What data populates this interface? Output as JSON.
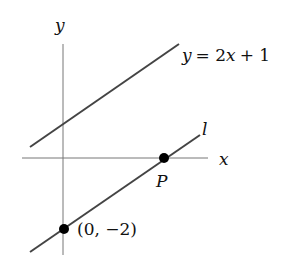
{
  "diagram": {
    "axes": {
      "x_label": "x",
      "y_label": "y"
    },
    "lines": [
      {
        "name": "upper",
        "equation": "y = 2x + 1",
        "label_var": "y",
        "label_eq": "= 2",
        "label_x": "x",
        "label_tail": "+ 1"
      },
      {
        "name": "l",
        "label": "l"
      }
    ],
    "points": [
      {
        "name": "P",
        "label": "P"
      },
      {
        "name": "y-intercept",
        "label": "(0, −2)"
      }
    ],
    "colors": {
      "line": "#444444",
      "axis": "#777777",
      "point": "#000000"
    }
  }
}
